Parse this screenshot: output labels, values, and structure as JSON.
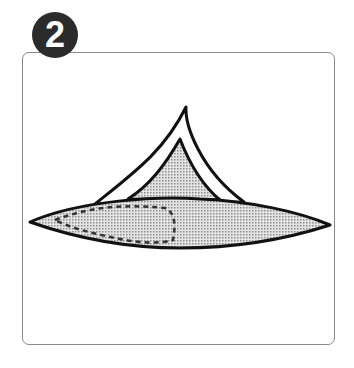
{
  "step": {
    "number": "2",
    "badge_color": "#2b2b2b",
    "badge_text_color": "#ffffff"
  },
  "illustration": {
    "description": "Origami-like fold step: a flattened shaded lens shape with a raised triangular flap; dashed outline indicates hidden fold",
    "fill_color": "#c9c9c9",
    "stroke_color": "#111111",
    "frame_border_color": "#8a8a8a"
  }
}
